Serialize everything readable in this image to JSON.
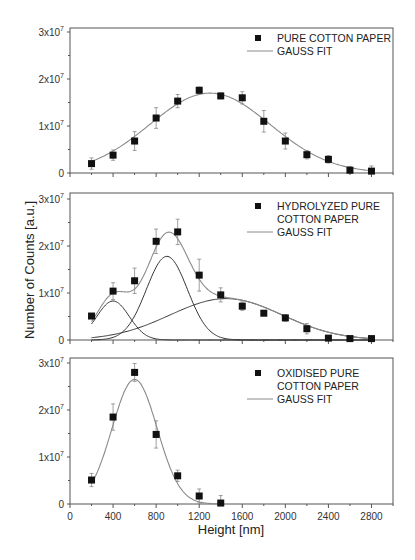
{
  "figure": {
    "ylabel": "Number of Counts [a.u.]",
    "xlabel": "Height [nm]"
  },
  "chart_data": [
    {
      "type": "scatter",
      "panel": 1,
      "title": "",
      "xlabel": "",
      "ylabel": "Number of Counts [a.u.]",
      "xlim": [
        0,
        3000
      ],
      "ylim": [
        0,
        30000000.0
      ],
      "xticks": [
        0,
        400,
        800,
        1200,
        1600,
        2000,
        2400,
        2800
      ],
      "yticks": [
        0,
        10000000.0,
        20000000.0,
        30000000.0
      ],
      "ytick_labels": [
        "0",
        "1x10^7",
        "2x10^7",
        "3x10^7"
      ],
      "legend": [
        "PURE COTTON PAPER",
        "GAUSS FIT"
      ],
      "legend_position": "upper right",
      "grid": false,
      "series": [
        {
          "name": "PURE COTTON PAPER",
          "x": [
            200,
            400,
            600,
            800,
            1000,
            1200,
            1400,
            1600,
            1800,
            2000,
            2200,
            2400,
            2600,
            2800
          ],
          "y": [
            2000000.0,
            3800000.0,
            6800000.0,
            11700000.0,
            15300000.0,
            17600000.0,
            16400000.0,
            16000000.0,
            11000000.0,
            6800000.0,
            3900000.0,
            2900000.0,
            600000.0,
            400000.0
          ],
          "err": [
            1200000.0,
            1100000.0,
            2000000.0,
            2200000.0,
            1400000.0,
            700000.0,
            600000.0,
            1300000.0,
            2300000.0,
            1700000.0,
            900000.0,
            800000.0,
            800000.0,
            1100000.0
          ]
        },
        {
          "name": "GAUSS FIT",
          "type": "gauss",
          "components": [
            {
              "center": 1300,
              "amplitude": 17000000.0,
              "sigma": 560
            }
          ]
        }
      ]
    },
    {
      "type": "scatter",
      "panel": 2,
      "title": "",
      "xlabel": "",
      "ylabel": "Number of Counts [a.u.]",
      "xlim": [
        0,
        3000
      ],
      "ylim": [
        0,
        30000000.0
      ],
      "xticks": [
        0,
        400,
        800,
        1200,
        1600,
        2000,
        2400,
        2800
      ],
      "yticks": [
        0,
        10000000.0,
        20000000.0,
        30000000.0
      ],
      "ytick_labels": [
        "0",
        "1x10^7",
        "2x10^7",
        "3x10^7"
      ],
      "legend": [
        "HYDROLYZED PURE COTTON PAPER",
        "GAUSS FIT"
      ],
      "legend_position": "upper right",
      "grid": false,
      "series": [
        {
          "name": "HYDROLYZED PURE COTTON PAPER",
          "x": [
            200,
            400,
            600,
            800,
            1000,
            1200,
            1400,
            1600,
            1800,
            2000,
            2200,
            2400,
            2600,
            2800
          ],
          "y": [
            5100000.0,
            10400000.0,
            12600000.0,
            21000000.0,
            23000000.0,
            13800000.0,
            9600000.0,
            7200000.0,
            5700000.0,
            4700000.0,
            2400000.0,
            400000.0,
            300000.0,
            300000.0
          ],
          "err": [
            400000.0,
            1800000.0,
            2700000.0,
            2600000.0,
            2700000.0,
            3400000.0,
            1500000.0,
            900000.0,
            500000.0,
            700000.0,
            1100000.0,
            300000.0,
            300000.0,
            300000.0
          ]
        },
        {
          "name": "GAUSS FIT",
          "type": "gauss",
          "components": [
            {
              "center": 400,
              "amplitude": 8300000.0,
              "sigma": 150
            },
            {
              "center": 900,
              "amplitude": 17800000.0,
              "sigma": 190
            },
            {
              "center": 1450,
              "amplitude": 8800000.0,
              "sigma": 520
            }
          ]
        }
      ]
    },
    {
      "type": "scatter",
      "panel": 3,
      "title": "",
      "xlabel": "Height [nm]",
      "ylabel": "Number of Counts [a.u.]",
      "xlim": [
        0,
        3000
      ],
      "ylim": [
        0,
        30000000.0
      ],
      "xticks": [
        0,
        400,
        800,
        1200,
        1600,
        2000,
        2400,
        2800
      ],
      "xtick_labels": [
        "0",
        "400",
        "800",
        "1200",
        "1600",
        "2000",
        "2400",
        "2800"
      ],
      "yticks": [
        0,
        10000000.0,
        20000000.0,
        30000000.0
      ],
      "ytick_labels": [
        "0",
        "1x10^7",
        "2x10^7",
        "3x10^7"
      ],
      "legend": [
        "OXIDISED PURE COTTON PAPER",
        "GAUSS FIT"
      ],
      "legend_position": "upper right",
      "grid": false,
      "series": [
        {
          "name": "OXIDISED PURE COTTON PAPER",
          "x": [
            200,
            400,
            600,
            800,
            1000,
            1200,
            1400
          ],
          "y": [
            5100000.0,
            18500000.0,
            28000000.0,
            14800000.0,
            6000000.0,
            1700000.0,
            200000.0
          ],
          "err": [
            1400000.0,
            2800000.0,
            1900000.0,
            2900000.0,
            1200000.0,
            1500000.0,
            1600000.0
          ]
        },
        {
          "name": "GAUSS FIT",
          "type": "gauss",
          "components": [
            {
              "center": 600,
              "amplitude": 26500000.0,
              "sigma": 210
            }
          ]
        }
      ]
    }
  ],
  "panels_layout": [
    {
      "top": 28,
      "bottom": 173,
      "zero_y": 173,
      "px_per_1e7": 47,
      "legend_lines": [
        "PURE COTTON PAPER"
      ],
      "legend_y": 42
    },
    {
      "top": 193,
      "bottom": 340,
      "zero_y": 340,
      "px_per_1e7": 47,
      "legend_lines": [
        "HYDROLYZED PURE",
        "COTTON PAPER"
      ],
      "legend_y": 210
    },
    {
      "top": 358,
      "bottom": 504,
      "zero_y": 504,
      "px_per_1e7": 47,
      "legend_lines": [
        "OXIDISED PURE",
        "COTTON PAPER"
      ],
      "legend_y": 377
    }
  ],
  "axis_px": {
    "x0": 70,
    "x_right": 393,
    "px_per_nm": 0.10767
  },
  "legend_fit_label": "GAUSS FIT",
  "colors": {
    "marker": "#111111",
    "fit": "#8a8a8a",
    "component": "#333333",
    "axis": "#555555"
  }
}
